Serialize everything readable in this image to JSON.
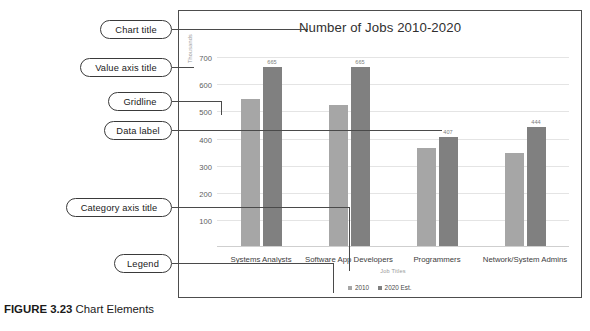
{
  "figure": {
    "number": "FIGURE 3.23",
    "caption": "Chart Elements"
  },
  "callouts": [
    {
      "id": "chart-title",
      "label": "Chart title"
    },
    {
      "id": "value-axis",
      "label": "Value axis title"
    },
    {
      "id": "gridline",
      "label": "Gridline"
    },
    {
      "id": "data-label",
      "label": "Data label"
    },
    {
      "id": "category-axis",
      "label": "Category axis title"
    },
    {
      "id": "legend",
      "label": "Legend"
    }
  ],
  "chart_data": {
    "type": "bar",
    "title": "Number of Jobs 2010-2020",
    "xlabel": "Job Titles",
    "ylabel": "Thousands",
    "categories": [
      "Systems Analysts",
      "Software App Developers",
      "Programmers",
      "Network/System Admins"
    ],
    "series": [
      {
        "name": "2010",
        "color": "#a6a6a6",
        "values": [
          544,
          524,
          364,
          347
        ],
        "data_labels": [
          "",
          "",
          "",
          ""
        ]
      },
      {
        "name": "2020 Est.",
        "color": "#808080",
        "values": [
          665,
          665,
          407,
          444
        ],
        "data_labels": [
          "665",
          "665",
          "407",
          "444"
        ]
      }
    ],
    "yticks": [
      700,
      600,
      500,
      400,
      300,
      200,
      100
    ],
    "ylim": [
      0,
      730
    ],
    "grid": true,
    "legend_position": "bottom"
  },
  "colors": {
    "series_2010": "#a6a6a6",
    "series_2020": "#808080",
    "gridline": "#e4e4e4",
    "frame": "#4d4d4d",
    "callout_border": "#3a3a3a"
  }
}
